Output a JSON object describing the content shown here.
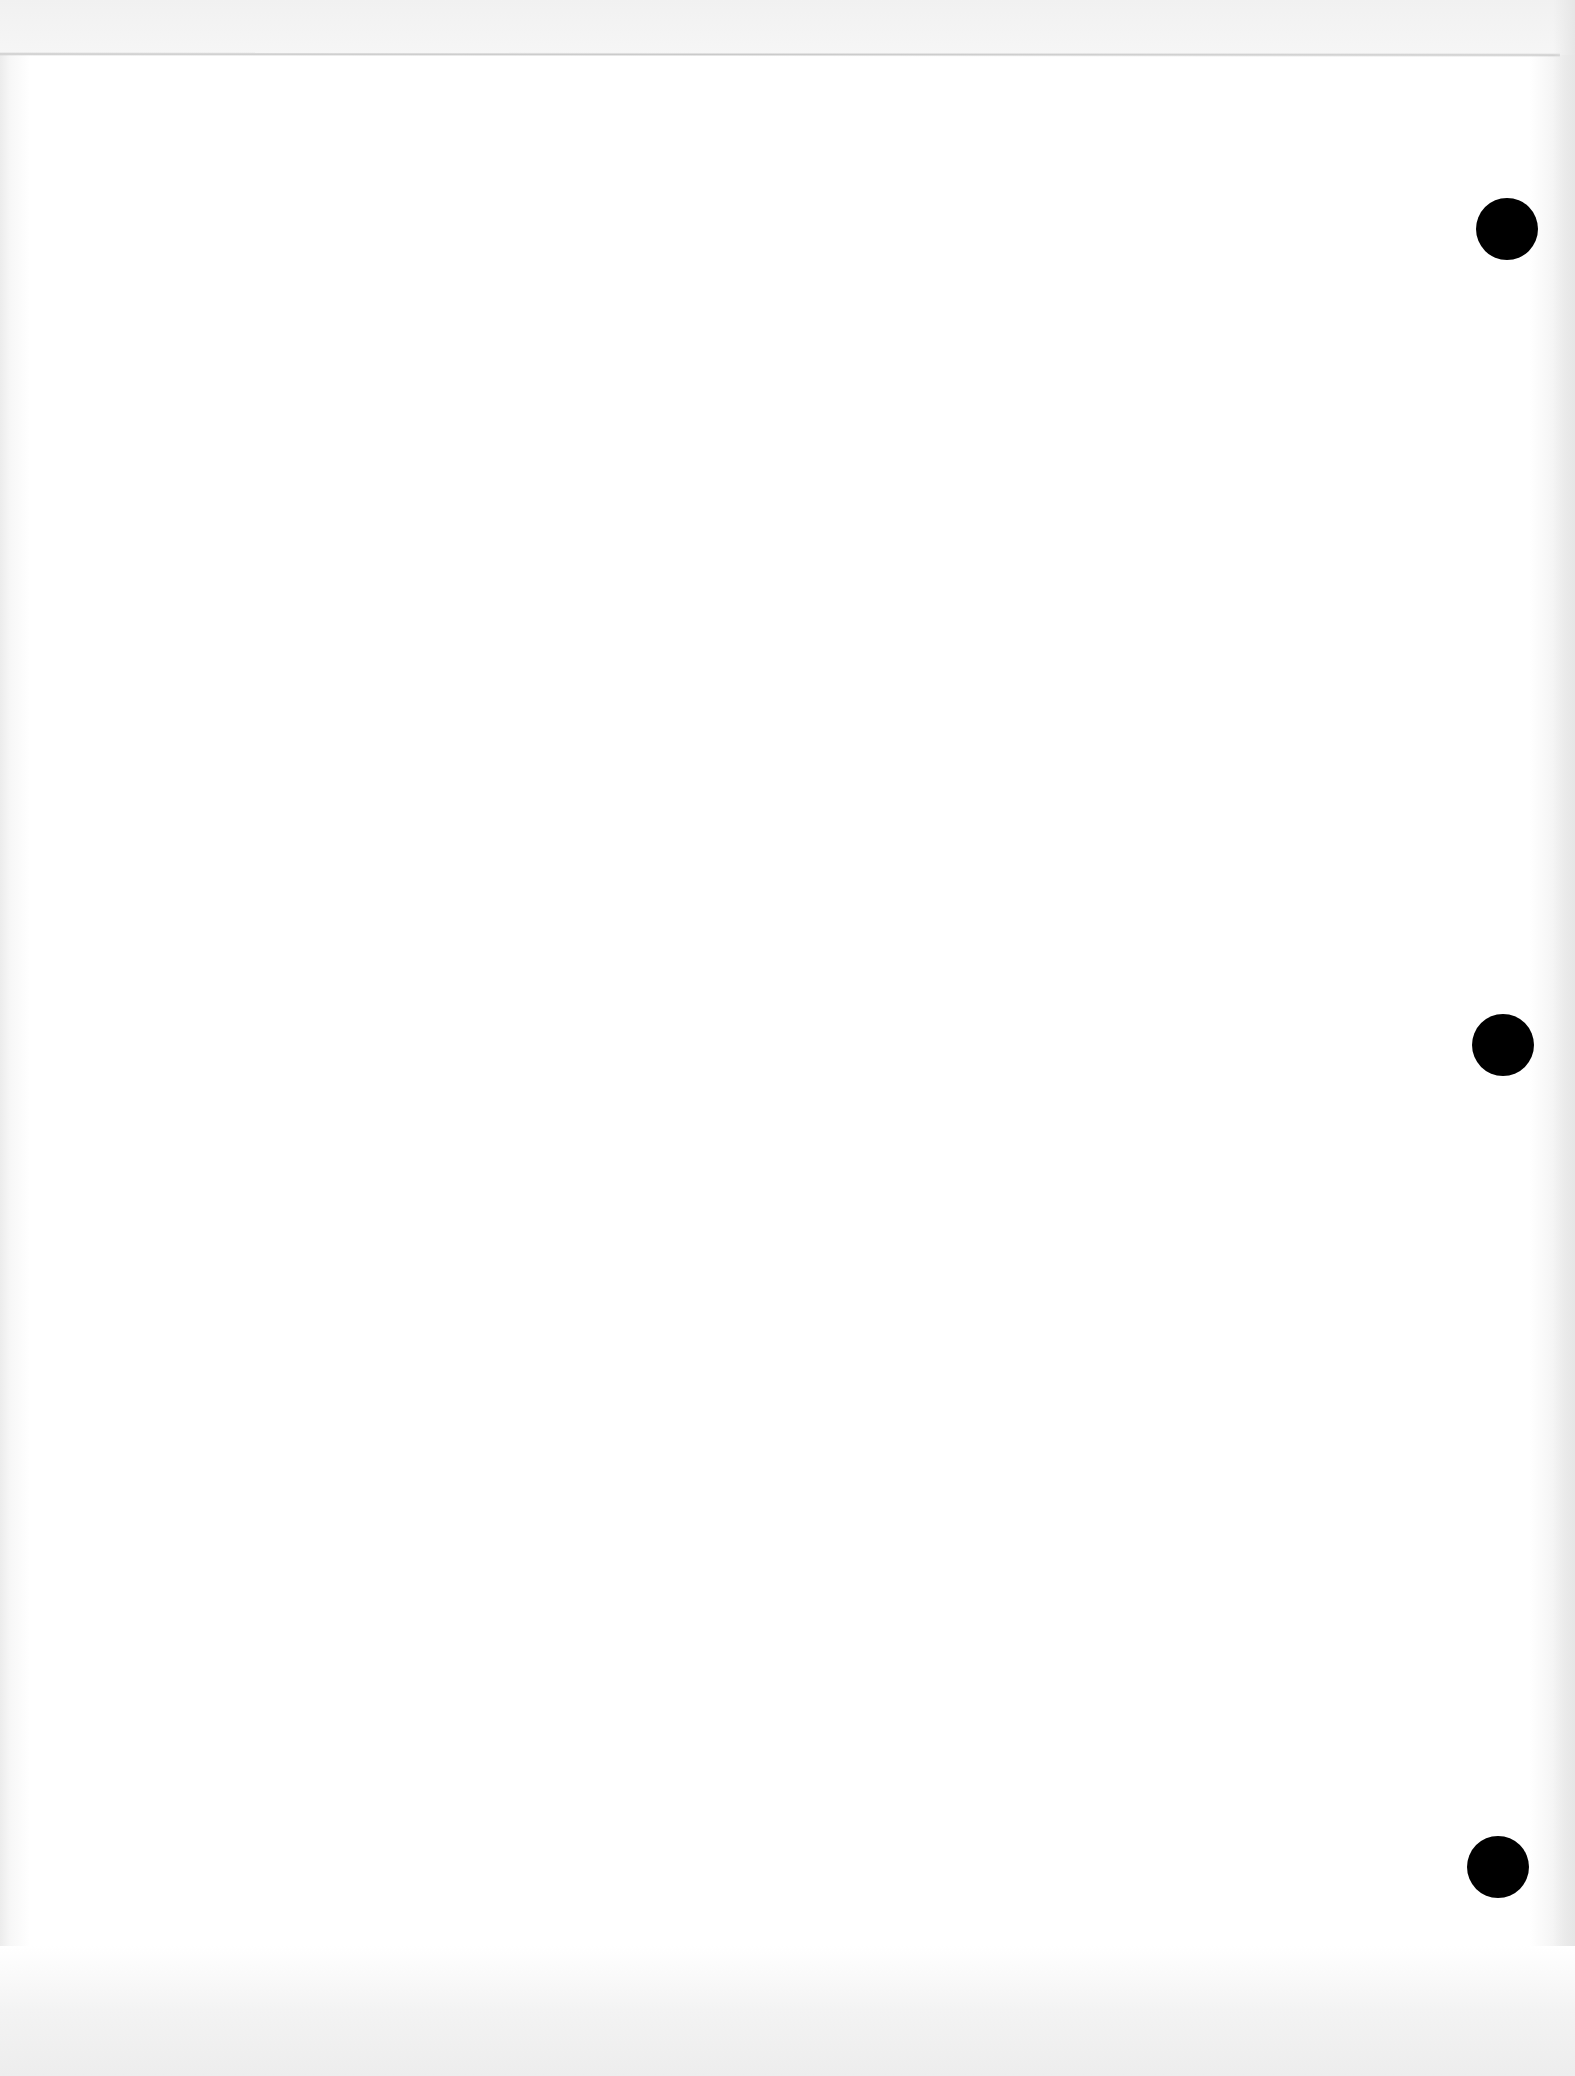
{
  "document": {
    "type": "blank scanned page",
    "text": "",
    "punch_holes": [
      {
        "cx": 1507,
        "cy": 229,
        "r": 31
      },
      {
        "cx": 1503,
        "cy": 1045,
        "r": 31
      },
      {
        "cx": 1498,
        "cy": 1867,
        "r": 31
      }
    ],
    "colors": {
      "paper": "#ffffff",
      "edge_shadow": "#ececec",
      "hole": "#000000"
    }
  }
}
